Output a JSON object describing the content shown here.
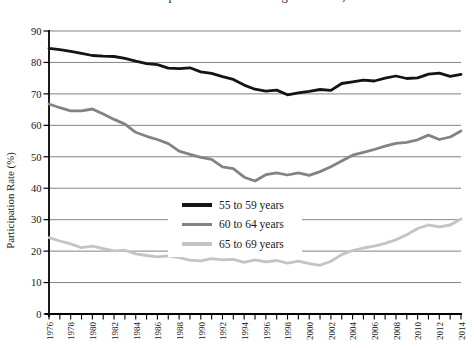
{
  "cropped_title": {
    "note": "title line is cut off at top edge of screenshot, only descender pixels visible",
    "text": "Labor Force Participation Rates of Men Ages 55 to 69, 1976-2014"
  },
  "chart_data": {
    "type": "line",
    "title": "",
    "xlabel": "",
    "ylabel": "Participation Rate (%)",
    "ylim": [
      0,
      90
    ],
    "ytick_interval": 10,
    "grid": true,
    "grid_color": "#848484",
    "axis_color": "#000000",
    "legend_position": "inside-center-left",
    "x_label_rotation": 90,
    "x_labeled_every": 2,
    "x": [
      1976,
      1977,
      1978,
      1979,
      1980,
      1981,
      1982,
      1983,
      1984,
      1985,
      1986,
      1987,
      1988,
      1989,
      1990,
      1991,
      1992,
      1993,
      1994,
      1995,
      1996,
      1997,
      1998,
      1999,
      2000,
      2001,
      2002,
      2003,
      2004,
      2005,
      2006,
      2007,
      2008,
      2009,
      2010,
      2011,
      2012,
      2013,
      2014
    ],
    "series": [
      {
        "name": "55 to 59 years",
        "color": "#141414",
        "line_width": 2.8,
        "swatch_height": 4,
        "values": [
          84.5,
          84.1,
          83.5,
          82.9,
          82.2,
          82.0,
          81.9,
          81.3,
          80.4,
          79.6,
          79.3,
          78.2,
          78.0,
          78.3,
          77.0,
          76.5,
          75.5,
          74.6,
          72.8,
          71.5,
          70.9,
          71.2,
          69.7,
          70.3,
          70.8,
          71.4,
          71.1,
          73.3,
          73.8,
          74.4,
          74.1,
          75.0,
          75.7,
          74.9,
          75.1,
          76.3,
          76.6,
          75.6,
          76.2
        ]
      },
      {
        "name": "60 to 64 years",
        "color": "#838383",
        "line_width": 2.8,
        "swatch_height": 3.5,
        "values": [
          66.8,
          65.6,
          64.6,
          64.6,
          65.2,
          63.6,
          61.9,
          60.4,
          57.8,
          56.5,
          55.5,
          54.2,
          51.8,
          50.8,
          49.8,
          49.2,
          46.8,
          46.2,
          43.5,
          42.3,
          44.3,
          44.9,
          44.2,
          44.9,
          44.1,
          45.3,
          46.8,
          48.7,
          50.5,
          51.4,
          52.3,
          53.4,
          54.3,
          54.6,
          55.4,
          56.9,
          55.5,
          56.3,
          58.2
        ]
      },
      {
        "name": "65 to 69 years",
        "color": "#c4c4c4",
        "line_width": 2.8,
        "swatch_height": 3.5,
        "values": [
          24.3,
          23.2,
          22.3,
          21.1,
          21.6,
          20.8,
          20.1,
          20.3,
          19.1,
          18.6,
          18.2,
          18.5,
          17.9,
          17.1,
          16.9,
          17.6,
          17.2,
          17.4,
          16.4,
          17.2,
          16.6,
          17.0,
          16.2,
          16.8,
          16.0,
          15.5,
          16.8,
          18.9,
          20.2,
          21.0,
          21.6,
          22.5,
          23.6,
          25.2,
          27.2,
          28.3,
          27.7,
          28.3,
          30.2
        ]
      }
    ]
  }
}
